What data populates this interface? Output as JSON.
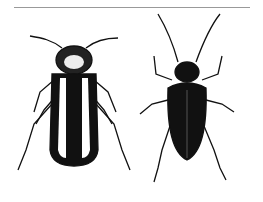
{
  "figure": {
    "subjects": [
      "striped-beetle",
      "dark-beetle"
    ],
    "colors": {
      "ink": "#111111",
      "background": "#ffffff",
      "rule": "#999999"
    }
  }
}
